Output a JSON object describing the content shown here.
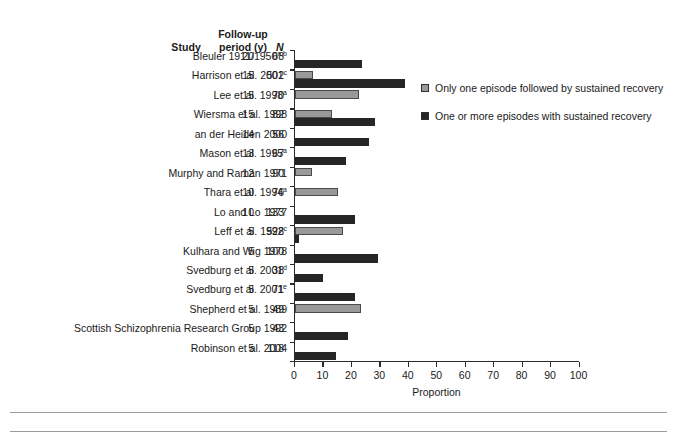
{
  "table_headers": {
    "study": "Study",
    "follow_up_line1": "Follow-up",
    "follow_up_line2": "period (y)",
    "n": "N"
  },
  "legend": {
    "items": [
      {
        "label": "Only one episode followed by sustained recovery",
        "color": "#999999",
        "key": "one_episode"
      },
      {
        "label": "One or more episodes with sustained recovery",
        "color": "#262626",
        "key": "one_or_more"
      }
    ]
  },
  "axis": {
    "xlabel": "Proportion",
    "xticks": [
      "0",
      "10",
      "20",
      "30",
      "40",
      "50",
      "60",
      "70",
      "80",
      "90",
      "100"
    ]
  },
  "rows": [
    {
      "study": "Bleuler 1911/1950",
      "sup": "a,b",
      "years": "20",
      "n": "68",
      "one_episode": null,
      "one_or_more": 23.3
    },
    {
      "study": "Harrison et al. 2001",
      "sup": "c",
      "years": "15",
      "n": "502",
      "one_episode": 6.2,
      "one_or_more": 38.5
    },
    {
      "study": "Lee et al. 1998",
      "sup": "a",
      "years": "15",
      "n": "70",
      "one_episode": 22.3,
      "one_or_more": null
    },
    {
      "study": "Wiersma et al. 1998",
      "sup": "",
      "years": "15",
      "n": "82",
      "one_episode": 12.9,
      "one_or_more": 27.9
    },
    {
      "study": "an der Heiden 2000",
      "sup": "",
      "years": "14",
      "n": "56",
      "one_episode": null,
      "one_or_more": 25.8
    },
    {
      "study": "Mason et al. 1995",
      "sup": "a",
      "years": "13",
      "n": "67",
      "one_episode": null,
      "one_or_more": 17.9
    },
    {
      "study": "Murphy and Raman 1971",
      "sup": "",
      "years": "12",
      "n": "90",
      "one_episode": 6.0,
      "one_or_more": null
    },
    {
      "study": "Thara et al. 1994",
      "sup": "a",
      "years": "10",
      "n": "76",
      "one_episode": 15.1,
      "one_or_more": null
    },
    {
      "study": "Lo and Lo 1977",
      "sup": "",
      "years": "10",
      "n": "133",
      "one_episode": null,
      "one_or_more": 21.1
    },
    {
      "study": "Leff et al. 1992",
      "sup": "c",
      "years": "5",
      "n": "528",
      "one_episode": 16.9,
      "one_or_more": 1.2
    },
    {
      "study": "Kulhara and Wig 1978",
      "sup": "",
      "years": "5",
      "n": "100",
      "one_episode": null,
      "one_or_more": 29.2
    },
    {
      "study": "Svedburg et al. 2001",
      "sup": "d",
      "years": "5",
      "n": "38",
      "one_episode": null,
      "one_or_more": 9.6
    },
    {
      "study": "Svedburg et al. 2001",
      "sup": "e",
      "years": "5",
      "n": "71",
      "one_episode": null,
      "one_or_more": 21.0
    },
    {
      "study": "Shepherd et al. 1989",
      "sup": "",
      "years": "5",
      "n": "49",
      "one_episode": 23.0,
      "one_or_more": null
    },
    {
      "study": "Scottish Schizophrenia Research Group 1992",
      "sup": "",
      "years": "5",
      "n": "43",
      "one_episode": null,
      "one_or_more": 18.5
    },
    {
      "study": "Robinson et al. 2004",
      "sup": "",
      "years": "5",
      "n": "118",
      "one_episode": null,
      "one_or_more": 14.2
    }
  ],
  "chart_data": {
    "type": "bar",
    "orientation": "horizontal",
    "title": "",
    "xlabel": "Proportion",
    "ylabel": "",
    "xlim": [
      0,
      100
    ],
    "grid": false,
    "legend_position": "right",
    "categories": [
      "Bleuler 1911/1950a,b",
      "Harrison et al. 2001c",
      "Lee et al. 1998a",
      "Wiersma et al. 1998",
      "an der Heiden 2000",
      "Mason et al. 1995a",
      "Murphy and Raman 1971",
      "Thara et al. 1994a",
      "Lo and Lo 1977",
      "Leff et al. 1992c",
      "Kulhara and Wig 1978",
      "Svedburg et al. 2001d",
      "Svedburg et al. 2001e",
      "Shepherd et al. 1989",
      "Scottish Schizophrenia Research Group 1992",
      "Robinson et al. 2004"
    ],
    "series": [
      {
        "name": "Only one episode followed by sustained recovery",
        "color": "#999999",
        "values": [
          null,
          6.2,
          22.3,
          12.9,
          null,
          null,
          6.0,
          15.1,
          null,
          16.9,
          null,
          null,
          null,
          23.0,
          null,
          null
        ]
      },
      {
        "name": "One or more episodes with sustained recovery",
        "color": "#262626",
        "values": [
          23.3,
          38.5,
          null,
          27.9,
          25.8,
          17.9,
          null,
          null,
          21.1,
          1.2,
          29.2,
          9.6,
          21.0,
          null,
          18.5,
          14.2
        ]
      }
    ],
    "follow_up_period_y": [
      20,
      15,
      15,
      15,
      14,
      13,
      12,
      10,
      10,
      5,
      5,
      5,
      5,
      5,
      5,
      5
    ],
    "n": [
      68,
      502,
      70,
      82,
      56,
      67,
      90,
      76,
      133,
      528,
      100,
      38,
      71,
      49,
      43,
      118
    ],
    "xticks": [
      0,
      10,
      20,
      30,
      40,
      50,
      60,
      70,
      80,
      90,
      100
    ]
  }
}
